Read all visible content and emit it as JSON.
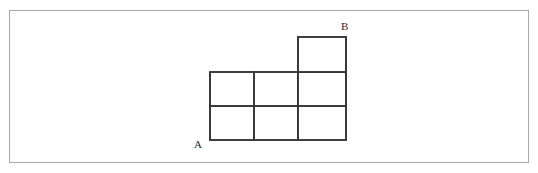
{
  "canvas": {
    "width": 538,
    "height": 173,
    "background_color": "#ffffff",
    "border_color": "#a9a9a9"
  },
  "figure": {
    "title": "",
    "stroke_color": "#333333",
    "stroke_width": 1.5,
    "cell_fill": "#ffffff",
    "cell_width": 44,
    "cell_height": 34,
    "origin": {
      "x": 210,
      "y": 140
    },
    "column_lines": [
      210,
      254,
      298,
      346
    ],
    "row_lines": [
      140,
      106,
      72,
      37
    ],
    "cells": [
      {
        "name": "cell-r1-c1",
        "x": 210,
        "y": 106,
        "w": 44,
        "h": 34
      },
      {
        "name": "cell-r1-c2",
        "x": 254,
        "y": 106,
        "w": 44,
        "h": 34
      },
      {
        "name": "cell-r1-c3",
        "x": 298,
        "y": 106,
        "w": 48,
        "h": 34
      },
      {
        "name": "cell-r2-c1",
        "x": 210,
        "y": 72,
        "w": 44,
        "h": 34
      },
      {
        "name": "cell-r2-c2",
        "x": 254,
        "y": 72,
        "w": 44,
        "h": 34
      },
      {
        "name": "cell-r2-c3",
        "x": 298,
        "y": 72,
        "w": 48,
        "h": 34
      },
      {
        "name": "cell-r3-c3",
        "x": 298,
        "y": 37,
        "w": 48,
        "h": 35
      }
    ],
    "outline_path": "M 210 140 L 346 140 L 346 37 L 298 37 L 298 72 L 210 72 Z",
    "interior_segments": [
      {
        "name": "horizontal-divider-mid",
        "x1": 210,
        "y1": 106,
        "x2": 346,
        "y2": 106
      },
      {
        "name": "horizontal-divider-top",
        "x1": 298,
        "y1": 72,
        "x2": 346,
        "y2": 72
      },
      {
        "name": "vertical-divider-1",
        "x1": 254,
        "y1": 72,
        "x2": 254,
        "y2": 140
      },
      {
        "name": "vertical-divider-2",
        "x1": 298,
        "y1": 72,
        "x2": 298,
        "y2": 140
      }
    ],
    "labels": {
      "a": "A",
      "b": "B"
    }
  }
}
